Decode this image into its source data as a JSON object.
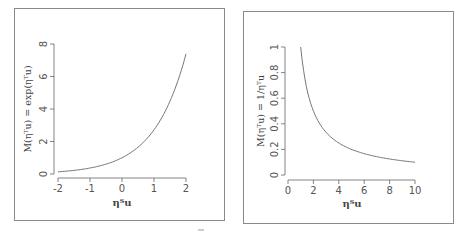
{
  "chart_data": [
    {
      "type": "line",
      "title": "",
      "xlabel": "ηᵀu",
      "ylabel": "M(ηᵀu) = exp(ηᵀu)",
      "xlim": [
        -2,
        2
      ],
      "ylim": [
        0,
        8
      ],
      "xticks": [
        "-2",
        "-1",
        "0",
        "1",
        "2"
      ],
      "yticks": [
        "0",
        "2",
        "4",
        "6",
        "8"
      ],
      "grid": false,
      "legend": null,
      "series": [
        {
          "name": "exp",
          "x": [
            -2,
            -1.5,
            -1,
            -0.5,
            0,
            0.5,
            1,
            1.5,
            2
          ],
          "y": [
            0.135,
            0.223,
            0.368,
            0.607,
            1.0,
            1.649,
            2.718,
            4.482,
            7.389
          ]
        }
      ]
    },
    {
      "type": "line",
      "title": "",
      "xlabel": "ηᵀu",
      "ylabel": "M(ηᵀu) = 1/ηᵀu",
      "xlim": [
        0,
        10
      ],
      "ylim": [
        0,
        1
      ],
      "xticks": [
        "0",
        "2",
        "4",
        "6",
        "8",
        "10"
      ],
      "yticks": [
        "0",
        "0.2",
        "0.4",
        "0.6",
        "0.8",
        "1"
      ],
      "grid": false,
      "legend": null,
      "series": [
        {
          "name": "reciprocal",
          "x": [
            1,
            1.25,
            1.5,
            2,
            2.5,
            3,
            4,
            5,
            6,
            7,
            8,
            9,
            10
          ],
          "y": [
            1.0,
            0.8,
            0.667,
            0.5,
            0.4,
            0.333,
            0.25,
            0.2,
            0.167,
            0.143,
            0.125,
            0.111,
            0.1
          ]
        }
      ]
    }
  ],
  "left": {
    "xlabel": "ηᵀu",
    "ylabel": "M(ηᵀu) = exp(ηᵀu)",
    "xticks": [
      "-2",
      "-1",
      "0",
      "1",
      "2"
    ],
    "yticks": [
      "0",
      "2",
      "4",
      "6",
      "8"
    ]
  },
  "right": {
    "xlabel": "ηᵀu",
    "ylabel": "M(ηᵀu) = 1/ηᵀu",
    "xticks": [
      "0",
      "2",
      "4",
      "6",
      "8",
      "10"
    ],
    "yticks": [
      "0",
      "0.2",
      "0.4",
      "0.6",
      "0.8",
      "1"
    ]
  }
}
